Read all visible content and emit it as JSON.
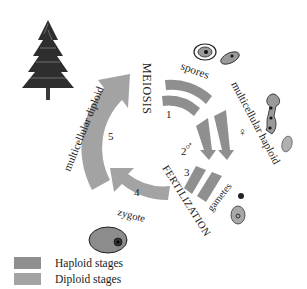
{
  "diagram": {
    "colors": {
      "haploid": "#8f8f8f",
      "diploid": "#a3a3a3",
      "background": "#ffffff",
      "text": "#1a1a1a"
    },
    "stages": [
      {
        "number": "1",
        "label": "spores",
        "ploidy": "haploid"
      },
      {
        "number": "2",
        "label": "multicellular haploid",
        "ploidy": "haploid"
      },
      {
        "number": "3",
        "label": "gametes",
        "ploidy": "haploid"
      },
      {
        "number": "4",
        "label": "zygote",
        "ploidy": "diploid"
      },
      {
        "number": "5",
        "label": "multicellular diploid",
        "ploidy": "diploid"
      }
    ],
    "processes": {
      "meiosis": "MEIOSIS",
      "fertilization": "FERTILIZATION"
    },
    "symbols": {
      "male": "♂",
      "female": "♀"
    },
    "illustrations": [
      {
        "name": "pine-tree",
        "stage": "multicellular diploid"
      },
      {
        "name": "spore-cells",
        "stage": "spores"
      },
      {
        "name": "female-gametophyte",
        "stage": "multicellular haploid"
      },
      {
        "name": "gamete-cells",
        "stage": "gametes"
      },
      {
        "name": "zygote-cell",
        "stage": "zygote"
      }
    ]
  },
  "legend": {
    "items": [
      {
        "label": "Haploid stages",
        "color": "#8f8f8f"
      },
      {
        "label": "Diploid stages",
        "color": "#a3a3a3"
      }
    ]
  }
}
